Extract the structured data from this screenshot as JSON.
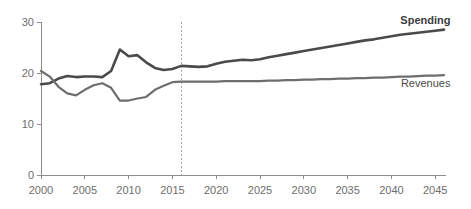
{
  "chart_data": {
    "type": "line",
    "title": "",
    "subtitle": "",
    "xlabel": "",
    "ylabel": "",
    "xlim": [
      2000,
      2046
    ],
    "ylim": [
      0,
      30
    ],
    "grid": false,
    "legend_position": "inline-right",
    "x_ticks": [
      "2000",
      "2005",
      "2010",
      "2015",
      "2020",
      "2025",
      "2030",
      "2035",
      "2040",
      "2045"
    ],
    "y_ticks": [
      "0",
      "10",
      "20",
      "30"
    ],
    "annotations": [
      {
        "name": "projection-divider",
        "type": "vline",
        "x": 2016,
        "label": ""
      }
    ],
    "x": [
      2000,
      2001,
      2002,
      2003,
      2004,
      2005,
      2006,
      2007,
      2008,
      2009,
      2010,
      2011,
      2012,
      2013,
      2014,
      2015,
      2016,
      2017,
      2018,
      2019,
      2020,
      2021,
      2022,
      2023,
      2024,
      2025,
      2026,
      2027,
      2028,
      2029,
      2030,
      2031,
      2032,
      2033,
      2034,
      2035,
      2036,
      2037,
      2038,
      2039,
      2040,
      2041,
      2042,
      2043,
      2044,
      2045,
      2046
    ],
    "series": [
      {
        "name": "Spending",
        "color": "#4a4a4a",
        "label_x": 2044,
        "label_y": 29.6,
        "values": [
          17.8,
          18.0,
          18.9,
          19.4,
          19.2,
          19.3,
          19.3,
          19.2,
          20.4,
          24.6,
          23.3,
          23.5,
          22.1,
          21.0,
          20.6,
          20.8,
          21.4,
          21.3,
          21.2,
          21.3,
          21.8,
          22.2,
          22.4,
          22.6,
          22.5,
          22.7,
          23.1,
          23.4,
          23.7,
          24.0,
          24.3,
          24.6,
          24.9,
          25.2,
          25.5,
          25.8,
          26.1,
          26.4,
          26.6,
          26.9,
          27.2,
          27.5,
          27.7,
          27.9,
          28.1,
          28.3,
          28.5
        ]
      },
      {
        "name": "Revenues",
        "color": "#6e6e6e",
        "label_x": 2044,
        "label_y": 17.3,
        "values": [
          20.4,
          19.3,
          17.3,
          16.0,
          15.6,
          16.7,
          17.6,
          18.0,
          17.1,
          14.6,
          14.6,
          15.0,
          15.3,
          16.7,
          17.5,
          18.2,
          18.3,
          18.3,
          18.3,
          18.3,
          18.3,
          18.4,
          18.4,
          18.4,
          18.4,
          18.4,
          18.5,
          18.5,
          18.6,
          18.6,
          18.7,
          18.7,
          18.8,
          18.8,
          18.9,
          18.9,
          19.0,
          19.0,
          19.1,
          19.1,
          19.2,
          19.3,
          19.3,
          19.4,
          19.5,
          19.5,
          19.6
        ]
      }
    ]
  },
  "labels": {
    "spending": "Spending",
    "revenues": "Revenues"
  }
}
